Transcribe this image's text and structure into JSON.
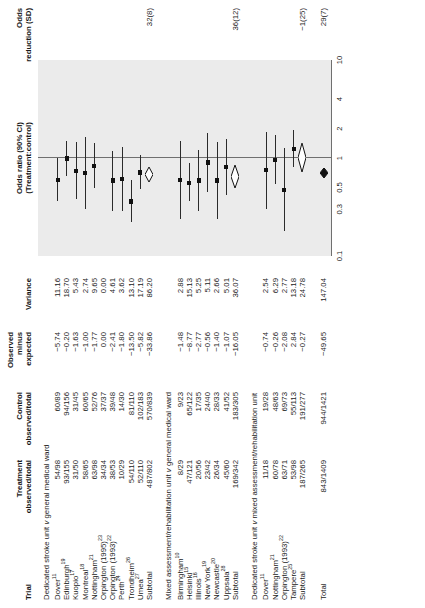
{
  "figure": {
    "type": "forest-plot",
    "columns": {
      "trial": "Trial",
      "treatment": [
        "Treatment",
        "observed/total"
      ],
      "control": [
        "Control",
        "observed/total"
      ],
      "ome": [
        "Observed",
        "minus",
        "expected"
      ],
      "variance": "Variance",
      "or": [
        "Odds ratio (90% CI)",
        "(Treatment:control)"
      ],
      "reduction": [
        "Odds",
        "reduction (SD)"
      ]
    },
    "axis": {
      "ticks": [
        "0.1",
        "0.3",
        "0.5",
        "1",
        "2",
        "4",
        "10"
      ],
      "tick_values": [
        0.1,
        0.3,
        0.5,
        1,
        2,
        4,
        10
      ],
      "null_value": 1,
      "scale": "log"
    },
    "groups": [
      {
        "name": "group-1",
        "heading_pre": "Dedicated stroke unit ",
        "heading_it": "v",
        "heading_post": " general medical ward",
        "rows": [
          {
            "trial": "Dover",
            "sup": "11",
            "treatment": "54/98",
            "control": "60/89",
            "ome": "−5.74",
            "variance": "11.16",
            "or": 0.6,
            "lo": 0.36,
            "hi": 1.0
          },
          {
            "trial": "Edinburgh",
            "sup": "19",
            "treatment": "93/155",
            "control": "94/156",
            "ome": "−0.20",
            "variance": "18.70",
            "or": 0.99,
            "lo": 0.66,
            "hi": 1.48
          },
          {
            "trial": "Kuopio",
            "sup": "17",
            "treatment": "31/50",
            "control": "31/45",
            "ome": "−1.63",
            "variance": "5.43",
            "or": 0.74,
            "lo": 0.38,
            "hi": 1.44
          },
          {
            "trial": "Montreal",
            "sup": "18",
            "treatment": "58/65",
            "control": "60/65",
            "ome": "−1.00",
            "variance": "2.74",
            "or": 0.7,
            "lo": 0.3,
            "hi": 1.62
          },
          {
            "trial": "Nottingham",
            "sup": "21",
            "treatment": "63/98",
            "control": "52/76",
            "ome": "−1.77",
            "variance": "9.65",
            "or": 0.83,
            "lo": 0.49,
            "hi": 1.41
          },
          {
            "trial": "Orpington (1995)",
            "sup": "23",
            "treatment": "34/34",
            "control": "37/37",
            "ome": "0.00",
            "variance": "0.00",
            "or": null,
            "lo": null,
            "hi": null
          },
          {
            "trial": "Orpington (1993)",
            "sup": "22",
            "treatment": "38/53",
            "control": "39/48",
            "ome": "−2.41",
            "variance": "4.61",
            "or": 0.59,
            "lo": 0.29,
            "hi": 1.19
          },
          {
            "trial": "Perth",
            "sup": "24",
            "treatment": "10/29",
            "control": "14/30",
            "ome": "−1.80",
            "variance": "3.62",
            "or": 0.61,
            "lo": 0.29,
            "hi": 1.3
          },
          {
            "trial": "Trondheim",
            "sup": "26",
            "treatment": "54/110",
            "control": "81/110",
            "ome": "−13.50",
            "variance": "13.10",
            "or": 0.36,
            "lo": 0.22,
            "hi": 0.59
          },
          {
            "trial": "Umea",
            "sup": "27",
            "treatment": "52/110",
            "control": "102/183",
            "ome": "−5.82",
            "variance": "17.19",
            "or": 0.71,
            "lo": 0.48,
            "hi": 1.07
          },
          {
            "trial": "Subtotal",
            "sup": "",
            "treatment": "487/802",
            "control": "570/839",
            "ome": "−33.86",
            "variance": "86.20",
            "or": 0.68,
            "lo": 0.57,
            "hi": 0.81,
            "summary": true
          }
        ],
        "reduction": "32(8)"
      },
      {
        "name": "group-2",
        "heading_pre": "Mixed assessment/rehabilitation unit ",
        "heading_it": "v",
        "heading_post": " general medical ward",
        "rows": [
          {
            "trial": "Birmingham",
            "sup": "10",
            "treatment": "8/29",
            "control": "9/23",
            "ome": "−1.48",
            "variance": "2.88",
            "or": 0.6,
            "lo": 0.24,
            "hi": 1.5
          },
          {
            "trial": "Helsinki",
            "sup": "15",
            "treatment": "47/121",
            "control": "65/122",
            "ome": "−8.77",
            "variance": "15.13",
            "or": 0.56,
            "lo": 0.36,
            "hi": 0.88
          },
          {
            "trial": "Illinois",
            "sup": "16",
            "treatment": "20/56",
            "control": "17/35",
            "ome": "−2.77",
            "variance": "5.25",
            "or": 0.59,
            "lo": 0.29,
            "hi": 1.2
          },
          {
            "trial": "New York",
            "sup": "19",
            "treatment": "23/42",
            "control": "24/40",
            "ome": "−0.56",
            "variance": "5.11",
            "or": 0.9,
            "lo": 0.45,
            "hi": 1.8
          },
          {
            "trial": "Newcastle",
            "sup": "20",
            "treatment": "26/34",
            "control": "28/33",
            "ome": "−1.40",
            "variance": "2.66",
            "or": 0.59,
            "lo": 0.24,
            "hi": 1.44
          },
          {
            "trial": "Uppsala",
            "sup": "28",
            "treatment": "45/60",
            "control": "41/52",
            "ome": "−1.07",
            "variance": "5.01",
            "or": 0.81,
            "lo": 0.42,
            "hi": 1.56
          },
          {
            "trial": "Subtotal",
            "sup": "",
            "treatment": "169/342",
            "control": "183/305",
            "ome": "−16.05",
            "variance": "36.07",
            "or": 0.64,
            "lo": 0.49,
            "hi": 0.84,
            "summary": true
          }
        ],
        "reduction": "36(12)"
      },
      {
        "name": "group-3",
        "heading_pre": "Dedicated stroke unit ",
        "heading_it": "v",
        "heading_post": " mixed assessment/rehabilitation unit",
        "rows": [
          {
            "trial": "Dover",
            "sup": "11",
            "treatment": "11/18",
            "control": "19/28",
            "ome": "−0.74",
            "variance": "2.54",
            "or": 0.75,
            "lo": 0.3,
            "hi": 1.84
          },
          {
            "trial": "Nottingham",
            "sup": "21",
            "treatment": "60/78",
            "control": "48/63",
            "ome": "−0.26",
            "variance": "6.29",
            "or": 0.96,
            "lo": 0.54,
            "hi": 1.7
          },
          {
            "trial": "Orpington (1993)",
            "sup": "22",
            "treatment": "63/71",
            "control": "69/73",
            "ome": "−2.08",
            "variance": "2.77",
            "or": 0.47,
            "lo": 0.18,
            "hi": 1.26
          },
          {
            "trial": "Tampere",
            "sup": "25",
            "treatment": "53/98",
            "control": "55/113",
            "ome": "2.84",
            "variance": "13.18",
            "or": 1.24,
            "lo": 0.8,
            "hi": 1.92
          },
          {
            "trial": "Subtotal",
            "sup": "",
            "treatment": "187/265",
            "control": "191/277",
            "ome": "−0.27",
            "variance": "24.78",
            "or": 1.01,
            "lo": 0.72,
            "hi": 1.42,
            "summary": true
          }
        ],
        "reduction": "−1(25)"
      }
    ],
    "total": {
      "trial": "Total",
      "treatment": "843/1409",
      "control": "944/1421",
      "ome": "−49.65",
      "variance": "147.04",
      "or": 0.71,
      "lo": 0.63,
      "hi": 0.8,
      "reduction": "29(7)",
      "summary": true
    }
  }
}
